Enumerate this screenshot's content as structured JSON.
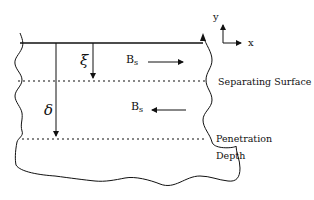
{
  "diagram": {
    "labels": {
      "xi": "ξ",
      "delta": "δ",
      "bs_top_base": "B",
      "bs_top_sub": "s",
      "bs_bottom_base": "B",
      "bs_bottom_sub": "s",
      "separating_surface": "Separating Surface",
      "penetration_line1": "Penetration",
      "penetration_line2": "Depth",
      "axis_y": "y",
      "axis_x": "x"
    },
    "arrows": {
      "bs_top_direction": "right",
      "bs_bottom_direction": "left"
    },
    "colors": {
      "stroke": "#111111",
      "background": "#ffffff"
    }
  }
}
